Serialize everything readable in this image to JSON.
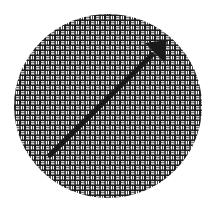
{
  "figure": {
    "shape": "circle",
    "fill_pattern": "basket-weave",
    "colors": {
      "background": "#ffffff",
      "mesh": "#1e1e1e",
      "arrow": "#1a1a1a"
    },
    "arrow": {
      "direction": "up-right",
      "icon": "arrow-icon"
    }
  }
}
